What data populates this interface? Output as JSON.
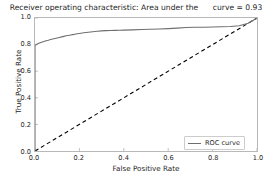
{
  "chart_data": {
    "type": "line",
    "title": "Receiver operating characteristic: Area under the      curve = 0.93",
    "xlabel": "False Positive Rate",
    "ylabel": "True Positive Rate",
    "xlim": [
      0.0,
      1.0
    ],
    "ylim": [
      0.0,
      1.0
    ],
    "xticks": [
      "0.0",
      "0.2",
      "0.4",
      "0.6",
      "0.8",
      "1.0"
    ],
    "xtick_values": [
      0.0,
      0.2,
      0.4,
      0.6,
      0.8,
      1.0
    ],
    "yticks": [
      "0.0",
      "0.2",
      "0.4",
      "0.6",
      "0.8",
      "1.0"
    ],
    "ytick_values": [
      0.0,
      0.2,
      0.4,
      0.6,
      0.8,
      1.0
    ],
    "grid": false,
    "legend_position": "lower right",
    "auc": 0.93,
    "series": [
      {
        "name": "ROC curve",
        "color": "#6f6f6f",
        "linestyle": "solid",
        "x": [
          0.0,
          0.0,
          0.01,
          0.02,
          0.03,
          0.04,
          0.05,
          0.06,
          0.07,
          0.08,
          0.09,
          0.1,
          0.11,
          0.12,
          0.13,
          0.14,
          0.15,
          0.16,
          0.17,
          0.18,
          0.19,
          0.2,
          0.22,
          0.24,
          0.26,
          0.28,
          0.3,
          0.32,
          0.34,
          0.36,
          0.38,
          0.4,
          0.44,
          0.48,
          0.52,
          0.56,
          0.6,
          0.64,
          0.68,
          0.72,
          0.76,
          0.8,
          0.84,
          0.88,
          0.92,
          0.96,
          1.0
        ],
        "y": [
          0.0,
          0.795,
          0.805,
          0.812,
          0.818,
          0.824,
          0.829,
          0.833,
          0.838,
          0.842,
          0.846,
          0.85,
          0.854,
          0.858,
          0.862,
          0.866,
          0.869,
          0.872,
          0.875,
          0.878,
          0.881,
          0.884,
          0.889,
          0.893,
          0.897,
          0.9,
          0.903,
          0.905,
          0.906,
          0.907,
          0.908,
          0.909,
          0.911,
          0.913,
          0.915,
          0.917,
          0.92,
          0.924,
          0.928,
          0.93,
          0.931,
          0.932,
          0.934,
          0.936,
          0.942,
          0.96,
          1.0
        ]
      },
      {
        "name": "chance-diagonal",
        "color": "#000000",
        "linestyle": "dashed",
        "x": [
          0.0,
          1.0
        ],
        "y": [
          0.0,
          1.0
        ]
      }
    ],
    "legend_entries": [
      {
        "label": "ROC curve",
        "color": "#6f6f6f"
      }
    ]
  }
}
